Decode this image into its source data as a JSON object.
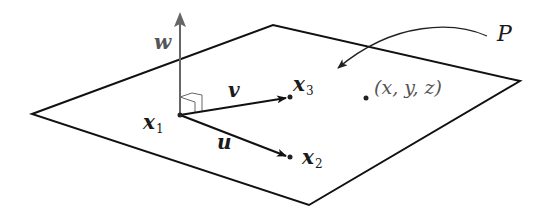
{
  "diagram": {
    "plane": {
      "label": "P",
      "corners": [
        [
          32,
          114
        ],
        [
          273,
          25
        ],
        [
          520,
          81
        ],
        [
          309,
          205
        ]
      ],
      "stroke": "#111111"
    },
    "points": {
      "x1": {
        "label_main": "x",
        "label_sub": "1",
        "pos": [
          180,
          115
        ]
      },
      "x2": {
        "label_main": "x",
        "label_sub": "2",
        "pos": [
          290,
          157
        ]
      },
      "x3": {
        "label_main": "x",
        "label_sub": "3",
        "pos": [
          290,
          97
        ]
      },
      "xyz": {
        "label": "(x, y, z)",
        "pos": [
          366,
          98
        ]
      }
    },
    "vectors": {
      "u": {
        "label": "u",
        "from": "x1",
        "to": "x2"
      },
      "v": {
        "label": "v",
        "from": "x1",
        "to": "x3"
      },
      "w": {
        "label": "w",
        "from": "x1",
        "direction": "normal",
        "color": "#666666"
      }
    },
    "colors": {
      "line": "#111111",
      "normal_vector": "#666666",
      "background": "#ffffff"
    }
  }
}
